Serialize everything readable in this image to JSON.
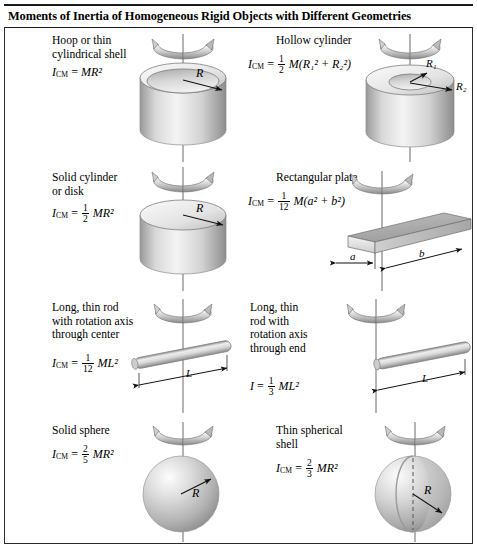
{
  "header": {
    "title": "Moments of Inertia of Homogeneous Rigid Objects with Different Geometries"
  },
  "objects": [
    {
      "id": "hoop",
      "name": "Hoop or thin cylindrical shell",
      "caption": "Hoop or thin\ncylindrical shell",
      "symbol": "I",
      "subscript": "CM",
      "equals": "=",
      "coefficient": "",
      "expression": "MR²",
      "radius_label": "R",
      "formula_plain": "I_CM = MR^2"
    },
    {
      "id": "hollow-cylinder",
      "name": "Hollow cylinder",
      "caption": "Hollow cylinder",
      "symbol": "I",
      "subscript": "CM",
      "equals": "=",
      "numerator": "1",
      "denominator": "2",
      "expression": "M(R₁² + R₂²)",
      "inner_radius_label": "R₁",
      "outer_radius_label": "R₂",
      "formula_plain": "I_CM = 1/2 M(R1^2 + R2^2)"
    },
    {
      "id": "solid-cylinder",
      "name": "Solid cylinder or disk",
      "caption": "Solid cylinder\nor disk",
      "symbol": "I",
      "subscript": "CM",
      "equals": "=",
      "numerator": "1",
      "denominator": "2",
      "expression": "MR²",
      "radius_label": "R",
      "formula_plain": "I_CM = 1/2 MR^2"
    },
    {
      "id": "rectangular-plate",
      "name": "Rectangular plate",
      "caption": "Rectangular plate",
      "symbol": "I",
      "subscript": "CM",
      "equals": "=",
      "numerator": "1",
      "denominator": "12",
      "expression": "M(a² + b²)",
      "side_a_label": "a",
      "side_b_label": "b",
      "formula_plain": "I_CM = 1/12 M(a^2 + b^2)"
    },
    {
      "id": "rod-center",
      "name": "Long, thin rod with rotation axis through center",
      "caption": "Long, thin rod\nwith rotation axis\nthrough center",
      "symbol": "I",
      "subscript": "CM",
      "equals": "=",
      "numerator": "1",
      "denominator": "12",
      "expression": "ML²",
      "length_label": "L",
      "formula_plain": "I_CM = 1/12 ML^2"
    },
    {
      "id": "rod-end",
      "name": "Long, thin rod with rotation axis through end",
      "caption": "Long, thin\nrod with\nrotation axis\nthrough end",
      "symbol": "I",
      "subscript": "",
      "equals": "=",
      "numerator": "1",
      "denominator": "3",
      "expression": "ML²",
      "length_label": "L",
      "formula_plain": "I = 1/3 ML^2"
    },
    {
      "id": "solid-sphere",
      "name": "Solid sphere",
      "caption": "Solid sphere",
      "symbol": "I",
      "subscript": "CM",
      "equals": "=",
      "numerator": "2",
      "denominator": "5",
      "expression": "MR²",
      "radius_label": "R",
      "formula_plain": "I_CM = 2/5 MR^2"
    },
    {
      "id": "thin-spherical-shell",
      "name": "Thin spherical shell",
      "caption": "Thin spherical\nshell",
      "symbol": "I",
      "subscript": "CM",
      "equals": "=",
      "numerator": "2",
      "denominator": "3",
      "expression": "MR²",
      "radius_label": "R",
      "formula_plain": "I_CM = 2/3 MR^2"
    }
  ],
  "colors": {
    "rule": "#1a1a1a",
    "frame": "#2b2b2b",
    "axis": "#5b5b5b",
    "shape_light": "#f2f2f2",
    "shape_mid": "#c9c9c9",
    "shape_dark": "#8f8f8f",
    "arrow": "#111111"
  }
}
